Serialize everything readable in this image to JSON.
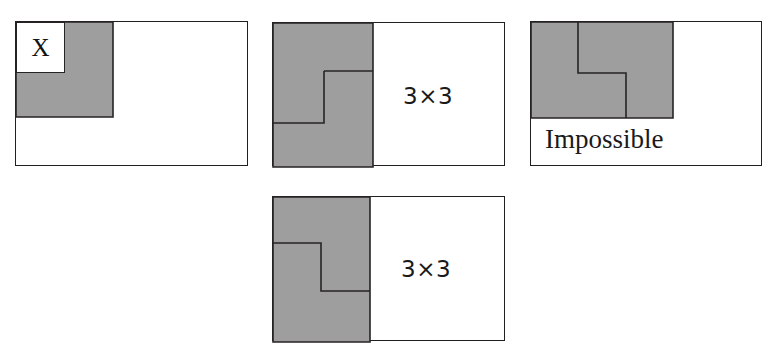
{
  "figure": {
    "background_color": "#ffffff",
    "shade_color": "#9e9e9e",
    "stroke_color": "#221f1f",
    "width": 782,
    "height": 357
  },
  "panels": [
    {
      "id": "panel-1",
      "name": "panel-x-marked",
      "frame": {
        "x": 15,
        "y": 21,
        "width": 233,
        "height": 145
      },
      "shaded_region": {
        "description": "square block in upper-left of frame with a white notch cell at its top-left corner",
        "points": "0,0 97,0 97,95 0,95"
      },
      "notch": {
        "x": 0,
        "y": 0,
        "width": 49,
        "height": 51,
        "filled": false
      },
      "cell_label": "X",
      "caption": ""
    },
    {
      "id": "panel-2",
      "name": "panel-top-middle-3x3",
      "frame": {
        "x": 272,
        "y": 22,
        "width": 233,
        "height": 144
      },
      "shaded_region": {
        "description": "left band fully shaded, with an internal step line forming an L-tromino outline",
        "points": "0,0 100,0 100,144 0,144"
      },
      "step_path": "M 100,0 L 100,100 L 51,100 L 51,48 L 0,48",
      "step_polyline": "51,48 51,100 0,100",
      "caption": "3×3",
      "caption_position": {
        "x": 130,
        "y": 62
      }
    },
    {
      "id": "panel-3",
      "name": "panel-impossible",
      "frame": {
        "x": 530,
        "y": 21,
        "width": 232,
        "height": 145
      },
      "shaded_region": {
        "description": "wide shaded band across the top of the frame with an internal step notch line",
        "points": "0,0 142,0 142,96 0,96"
      },
      "step_polyline": "47,0 47,51 95,51 95,96",
      "caption": "Impossible",
      "caption_position": {
        "x": 14,
        "y": 104
      }
    },
    {
      "id": "panel-4",
      "name": "panel-bottom-middle-3x3",
      "frame": {
        "x": 272,
        "y": 196,
        "width": 233,
        "height": 145
      },
      "shaded_region": {
        "description": "left band fully shaded, with an internal step line forming an L-tromino outline",
        "points": "0,0 97,0 97,145 0,145"
      },
      "step_polyline": "0,46 48,46 48,94 97,94",
      "caption": "3×3",
      "caption_position": {
        "x": 128,
        "y": 61
      }
    }
  ]
}
